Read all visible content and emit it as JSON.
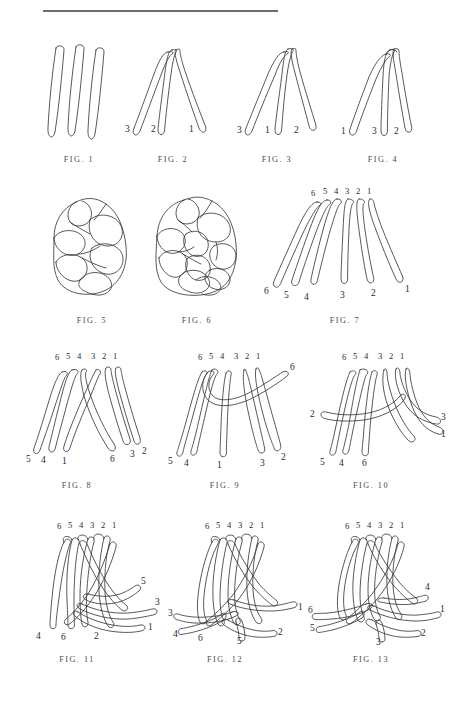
{
  "plate": {
    "title": "Braiding / plaiting instructional figure plate",
    "background_color": "#ffffff",
    "ink_color": "#3a3a3a",
    "rule_color": "#6d6d6d",
    "rule": {
      "visible": true,
      "x": 43,
      "y": 10,
      "width": 235
    }
  },
  "figures": [
    {
      "id": "fig-1",
      "caption": "FIG. 1",
      "description": "Three separate upright loops of cord, unbraided, side by side.",
      "strand_count": 3,
      "top_labels": [],
      "bottom_labels": [],
      "side_labels": []
    },
    {
      "id": "fig-2",
      "caption": "FIG. 2",
      "description": "Three loops gathered at the top, ends fanning down and out.",
      "strand_count": 3,
      "top_labels": [],
      "bottom_labels": [
        "3",
        "2",
        "1"
      ],
      "side_labels": []
    },
    {
      "id": "fig-3",
      "caption": "FIG. 3",
      "description": "Three loops gathered at top with a first crossing; ends reordered.",
      "strand_count": 3,
      "top_labels": [],
      "bottom_labels": [
        "3",
        "1",
        "2"
      ],
      "side_labels": []
    },
    {
      "id": "fig-4",
      "caption": "FIG. 4",
      "description": "Three loops after a further crossing at the head; ends reordered again.",
      "strand_count": 3,
      "top_labels": [],
      "bottom_labels": [
        "1",
        "3",
        "2"
      ],
      "side_labels": []
    },
    {
      "id": "fig-5",
      "caption": "FIG. 5",
      "description": "Completed three-strand plaited knot, rounded body, viewed from the side.",
      "strand_count": 3,
      "top_labels": [],
      "bottom_labels": [],
      "side_labels": []
    },
    {
      "id": "fig-6",
      "caption": "FIG. 6",
      "description": "Completed six-strand plaited knot, denser body, viewed from the side.",
      "strand_count": 6,
      "top_labels": [],
      "bottom_labels": [],
      "side_labels": []
    },
    {
      "id": "fig-7",
      "caption": "FIG. 7",
      "description": "Six loops hung from a common head, ends fanned out, numbered both ends.",
      "strand_count": 6,
      "top_labels": [
        "6",
        "5",
        "4",
        "3",
        "2",
        "1"
      ],
      "bottom_labels": [
        "6",
        "5",
        "4",
        "3",
        "2",
        "1"
      ],
      "side_labels": []
    },
    {
      "id": "fig-8",
      "caption": "FIG. 8",
      "description": "Six strands with the two centre groups crossed over one another.",
      "strand_count": 6,
      "top_labels": [
        "6",
        "5",
        "4",
        "3",
        "2",
        "1"
      ],
      "bottom_labels": [
        "5",
        "4",
        "1",
        "6",
        "3",
        "2"
      ],
      "side_labels": []
    },
    {
      "id": "fig-9",
      "caption": "FIG. 9",
      "description": "Strand 6 carried across to the right over the other strands.",
      "strand_count": 6,
      "top_labels": [
        "6",
        "5",
        "4",
        "3",
        "2",
        "1"
      ],
      "bottom_labels": [
        "5",
        "4",
        "1",
        "3",
        "2"
      ],
      "side_labels": [
        {
          "text": "6",
          "position": "upper-right"
        }
      ]
    },
    {
      "id": "fig-10",
      "caption": "FIG. 10",
      "description": "Strand 2 taken across to the left; strands 3 and 1 lie out to the right.",
      "strand_count": 6,
      "top_labels": [
        "6",
        "5",
        "4",
        "3",
        "2",
        "1"
      ],
      "bottom_labels": [
        "5",
        "4",
        "6"
      ],
      "side_labels": [
        {
          "text": "2",
          "position": "left"
        },
        {
          "text": "3",
          "position": "right-upper"
        },
        {
          "text": "1",
          "position": "right-lower"
        }
      ]
    },
    {
      "id": "fig-11",
      "caption": "FIG. 11",
      "description": "Plait carried further; strands 5, 3 and 1 emerge to the right.",
      "strand_count": 6,
      "top_labels": [
        "6",
        "5",
        "4",
        "3",
        "2",
        "1"
      ],
      "bottom_labels": [
        "4",
        "6",
        "2"
      ],
      "side_labels": [
        {
          "text": "5",
          "position": "right-upper"
        },
        {
          "text": "3",
          "position": "right-middle"
        },
        {
          "text": "1",
          "position": "right-lower"
        }
      ]
    },
    {
      "id": "fig-12",
      "caption": "FIG. 12",
      "description": "Further round of plaiting; strand 1 to the right, strand 3 to the left.",
      "strand_count": 6,
      "top_labels": [
        "6",
        "5",
        "4",
        "3",
        "2",
        "1"
      ],
      "bottom_labels": [
        "4",
        "6",
        "5"
      ],
      "side_labels": [
        {
          "text": "1",
          "position": "right"
        },
        {
          "text": "3",
          "position": "left"
        },
        {
          "text": "2",
          "position": "right-lower"
        }
      ]
    },
    {
      "id": "fig-13",
      "caption": "FIG. 13",
      "description": "Final round shown; strands 6 and 5 to the left, 4, 1 and 2 to the right, 3 below.",
      "strand_count": 6,
      "top_labels": [
        "6",
        "5",
        "4",
        "3",
        "2",
        "1"
      ],
      "bottom_labels": [
        "3"
      ],
      "side_labels": [
        {
          "text": "6",
          "position": "left-upper"
        },
        {
          "text": "5",
          "position": "left-lower"
        },
        {
          "text": "4",
          "position": "right-upper"
        },
        {
          "text": "1",
          "position": "right-middle"
        },
        {
          "text": "2",
          "position": "right-lower"
        }
      ]
    }
  ]
}
